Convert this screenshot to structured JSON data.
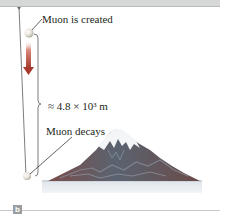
{
  "figure": {
    "panel_label": "b",
    "labels": {
      "created": "Muon is created",
      "distance": "≈ 4.8 × 10³ m",
      "decays": "Muon decays"
    },
    "colors": {
      "arrow": "#b5473a",
      "muon": "#e8e4dc",
      "mountain_dark": "#5b6572",
      "mountain_red": "#8b4a44",
      "snow": "#f4f5f7",
      "ground": "#cfd6dc",
      "topbar": "#d6d8d8"
    }
  }
}
